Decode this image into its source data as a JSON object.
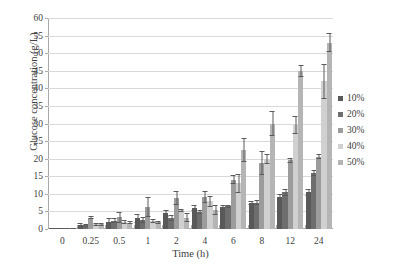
{
  "chart_data": {
    "type": "bar",
    "title": "",
    "xlabel": "Time (h)",
    "ylabel": "Glucose concentration (g/L)",
    "ylim": [
      0,
      60
    ],
    "yticks": [
      0,
      5,
      10,
      15,
      20,
      25,
      30,
      35,
      40,
      45,
      50,
      55,
      60
    ],
    "grid": true,
    "legend_position": "right",
    "categories": [
      "0",
      "0.25",
      "0.5",
      "1",
      "2",
      "4",
      "6",
      "8",
      "12",
      "24"
    ],
    "series": [
      {
        "name": "10%",
        "color": "#595959",
        "values": [
          0.1,
          1.0,
          2.1,
          3.1,
          4.5,
          5.9,
          6.4,
          7.3,
          9.0,
          10.4
        ],
        "errors": [
          0.2,
          0.6,
          0.9,
          1.3,
          1.0,
          0.9,
          0.4,
          0.6,
          0.9,
          0.9
        ]
      },
      {
        "name": "20%",
        "color": "#6e6e6e",
        "values": [
          0.1,
          1.0,
          2.3,
          2.6,
          3.1,
          4.9,
          6.5,
          7.5,
          10.4,
          16.0
        ],
        "errors": [
          0.2,
          0.5,
          0.7,
          0.9,
          0.9,
          0.5,
          0.4,
          0.7,
          0.9,
          0.9
        ]
      },
      {
        "name": "30%",
        "color": "#9c9c9c",
        "values": [
          0.1,
          3.2,
          3.3,
          6.2,
          8.8,
          9.2,
          14.0,
          18.8,
          19.5,
          20.5
        ],
        "errors": [
          0.2,
          0.4,
          1.5,
          2.8,
          1.9,
          1.7,
          1.3,
          3.3,
          0.7,
          0.7
        ]
      },
      {
        "name": "40%",
        "color": "#d0d0d0",
        "values": [
          0.1,
          1.3,
          2.0,
          2.2,
          5.3,
          7.9,
          13.0,
          20.0,
          29.5,
          42.0
        ],
        "errors": [
          0.2,
          0.3,
          0.5,
          0.6,
          0.4,
          1.5,
          2.7,
          1.4,
          2.5,
          5.0
        ]
      },
      {
        "name": "50%",
        "color": "#b5b5b5",
        "values": [
          0.1,
          1.3,
          1.8,
          1.9,
          3.2,
          5.4,
          22.5,
          30.0,
          45.0,
          53.0
        ],
        "errors": [
          0.2,
          0.3,
          0.5,
          0.5,
          1.3,
          1.5,
          3.5,
          3.5,
          1.7,
          2.7
        ]
      }
    ]
  },
  "legend": {
    "items": [
      {
        "label": "10%"
      },
      {
        "label": "20%"
      },
      {
        "label": "30%"
      },
      {
        "label": "40%"
      },
      {
        "label": "50%"
      }
    ]
  }
}
